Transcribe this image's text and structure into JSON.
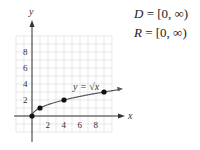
{
  "chart_data": {
    "type": "line",
    "title": "",
    "xlabel": "x",
    "ylabel": "y",
    "xlim": [
      -2,
      10
    ],
    "ylim": [
      -2,
      10
    ],
    "grid": true,
    "x_ticks": [
      2,
      4,
      6,
      8
    ],
    "y_ticks": [
      2,
      4,
      6,
      8
    ],
    "series": [
      {
        "name": "y = √x",
        "x": [
          0,
          1,
          4,
          9
        ],
        "y": [
          0,
          1,
          2,
          3
        ],
        "markers": true
      }
    ],
    "annotations": [
      "y = √x"
    ]
  },
  "annotations": {
    "curve_label": "y = √x",
    "domain": {
      "var": "D",
      "value": "= [0, ∞)"
    },
    "range": {
      "var": "R",
      "value": "= [0, ∞)"
    }
  },
  "colors": {
    "axis": "#333333",
    "grid": "#d8d8d8",
    "curve": "#555555",
    "point": "#111111"
  }
}
